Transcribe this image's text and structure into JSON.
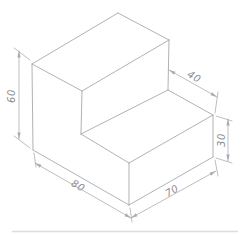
{
  "diagram": {
    "type": "isometric-technical-drawing",
    "background": "#ffffff",
    "line_color": "#a6a9ab",
    "dim_color": "#aaadaf",
    "text_color": "#8c8e90",
    "line_width": 0.9,
    "dim_width": 0.8,
    "font_size": 10,
    "vertices": {
      "O": [
        129,
        205
      ],
      "A": [
        33,
        150
      ],
      "B": [
        213,
        157
      ],
      "D": [
        129,
        163
      ],
      "T": [
        213,
        115
      ],
      "E40": [
        81,
        134
      ],
      "F40": [
        168,
        90
      ],
      "L1": [
        32,
        64
      ],
      "K": [
        118,
        13
      ],
      "F1": [
        82,
        91
      ],
      "R1": [
        169,
        40
      ]
    },
    "edges": [
      [
        "A",
        "O"
      ],
      [
        "O",
        "B"
      ],
      [
        "A",
        "L1"
      ],
      [
        "O",
        "D"
      ],
      [
        "B",
        "T"
      ],
      [
        "D",
        "E40"
      ],
      [
        "D",
        "T"
      ],
      [
        "E40",
        "F40"
      ],
      [
        "F40",
        "T"
      ],
      [
        "L1",
        "K"
      ],
      [
        "K",
        "R1"
      ],
      [
        "R1",
        "F1"
      ],
      [
        "F1",
        "L1"
      ],
      [
        "F1",
        "E40"
      ],
      [
        "R1",
        "F40"
      ]
    ],
    "dimensions": [
      {
        "label": "60",
        "line": [
          [
            19,
            51
          ],
          [
            19,
            139
          ]
        ],
        "extensions": [
          [
            [
              30,
              60
            ],
            [
              14,
              48
            ]
          ],
          [
            [
              30,
              148
            ],
            [
              14,
              136
            ]
          ]
        ],
        "text_pos": [
          12,
          96
        ],
        "text_rotation": -90
      },
      {
        "label": "40",
        "line": [
          [
            169,
            70
          ],
          [
            217,
            97
          ]
        ],
        "extensions": [
          [
            [
              218,
              92
            ],
            [
              215,
              113
            ]
          ]
        ],
        "text_pos": [
          194,
          77
        ],
        "text_rotation": 30
      },
      {
        "label": "30",
        "line": [
          [
            228,
            119
          ],
          [
            228,
            161
          ]
        ],
        "extensions": [
          [
            [
              216,
              116
            ],
            [
              232,
              121
            ]
          ],
          [
            [
              216,
              158
            ],
            [
              232,
              163
            ]
          ]
        ],
        "text_pos": [
          222,
          140
        ],
        "text_rotation": -90
      },
      {
        "label": "80",
        "line": [
          [
            35,
            163
          ],
          [
            131,
            218
          ]
        ],
        "extensions": [
          [
            [
              34,
              153
            ],
            [
              36,
              167
            ]
          ],
          [
            [
              130,
              208
            ],
            [
              132,
              222
            ]
          ]
        ],
        "text_pos": [
          78,
          186
        ],
        "text_rotation": 30
      },
      {
        "label": "70",
        "line": [
          [
            131,
            218
          ],
          [
            216,
            171
          ]
        ],
        "extensions": [
          [
            [
              215,
              160
            ],
            [
              218,
              176
            ]
          ]
        ],
        "text_pos": [
          172,
          191
        ],
        "text_rotation": -30
      }
    ],
    "scan_artifact": {
      "y": 231.5,
      "x1": 12,
      "x2": 238,
      "color": "#dadada",
      "width": 1.6
    }
  }
}
